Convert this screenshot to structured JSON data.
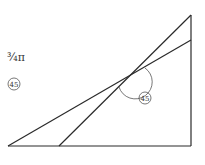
{
  "diagram": {
    "type": "geometry",
    "stroke_color": "#2a2a2a",
    "background": "#ffffff",
    "labels": {
      "top_left_annotation": "¾π",
      "left_circled_label": "45",
      "angle_circled_label": "45"
    },
    "labels_note": "handwritten glyphs, approximate transcription",
    "segments": [
      {
        "name": "base",
        "x1": 8,
        "y1": 146,
        "x2": 191,
        "y2": 146
      },
      {
        "name": "right-side",
        "x1": 191,
        "y1": 15,
        "x2": 191,
        "y2": 146
      },
      {
        "name": "shallow-line",
        "x1": 8,
        "y1": 146,
        "x2": 191,
        "y2": 40
      },
      {
        "name": "steep-line",
        "x1": 59,
        "y1": 146,
        "x2": 191,
        "y2": 15
      }
    ],
    "intersection": {
      "x": 130,
      "y": 76
    },
    "angle_arc": {
      "cx": 130,
      "cy": 76,
      "r": 17
    }
  }
}
